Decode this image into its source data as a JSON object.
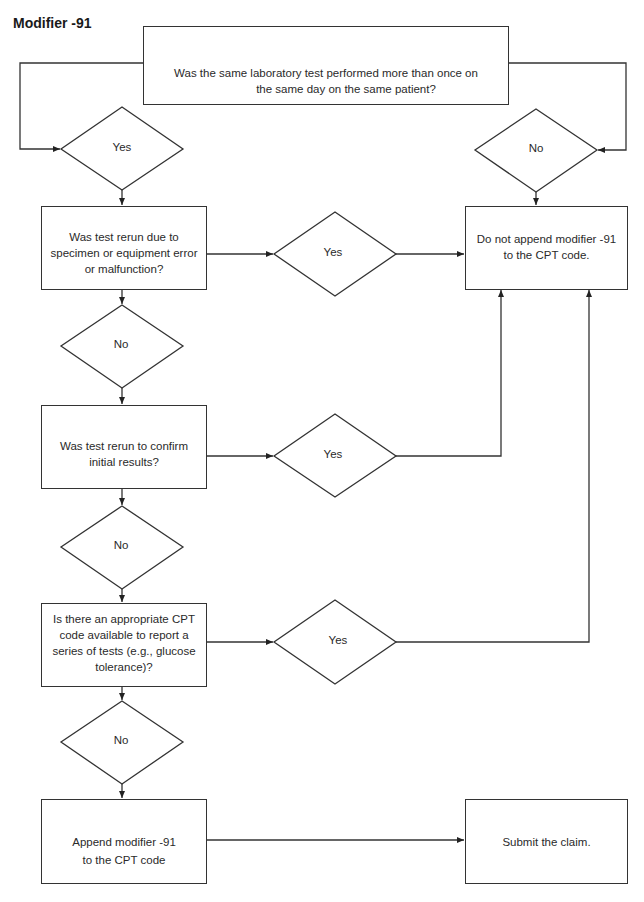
{
  "title": "Modifier -91",
  "nodes": {
    "start": "Was the same laboratory test performed more than once on the same day on the same patient?",
    "start_line1": "Was the same laboratory test performed more than once on",
    "start_line2": "the same day on the same patient?",
    "q1": "Was test rerun due to specimen or equipment error or malfunction?",
    "q1_lines": [
      "Was test rerun due to",
      "specimen or equipment error",
      "or malfunction?"
    ],
    "q2": "Was test rerun to confirm initial results?",
    "q2_lines": [
      "Was test rerun to confirm",
      "initial results?"
    ],
    "q3": "Is there an appropriate CPT code available to report a series of tests (e.g., glucose tolerance)?",
    "q3_lines": [
      "Is there an appropriate CPT",
      "code available to report a",
      "series of tests (e.g., glucose",
      "tolerance)?"
    ],
    "do_not_append_lines": [
      "Do not append modifier -91",
      "to the CPT code."
    ],
    "append_lines": [
      "Append modifier -91",
      "to the CPT code"
    ],
    "submit": "Submit the claim."
  },
  "decisions": {
    "start_yes": "Yes",
    "start_no": "No",
    "q1_yes": "Yes",
    "q1_no": "No",
    "q2_yes": "Yes",
    "q2_no": "No",
    "q3_yes": "Yes",
    "q3_no": "No"
  },
  "edges": [
    {
      "from": "start",
      "to": "start_yes"
    },
    {
      "from": "start",
      "to": "start_no"
    },
    {
      "from": "start_yes",
      "to": "q1"
    },
    {
      "from": "start_no",
      "to": "do_not_append"
    },
    {
      "from": "q1",
      "to": "q1_yes"
    },
    {
      "from": "q1_yes",
      "to": "do_not_append"
    },
    {
      "from": "q1",
      "to": "q1_no"
    },
    {
      "from": "q1_no",
      "to": "q2"
    },
    {
      "from": "q2",
      "to": "q2_yes"
    },
    {
      "from": "q2_yes",
      "to": "do_not_append"
    },
    {
      "from": "q2",
      "to": "q2_no"
    },
    {
      "from": "q2_no",
      "to": "q3"
    },
    {
      "from": "q3",
      "to": "q3_yes"
    },
    {
      "from": "q3_yes",
      "to": "do_not_append"
    },
    {
      "from": "q3",
      "to": "q3_no"
    },
    {
      "from": "q3_no",
      "to": "append"
    },
    {
      "from": "append",
      "to": "submit"
    }
  ]
}
